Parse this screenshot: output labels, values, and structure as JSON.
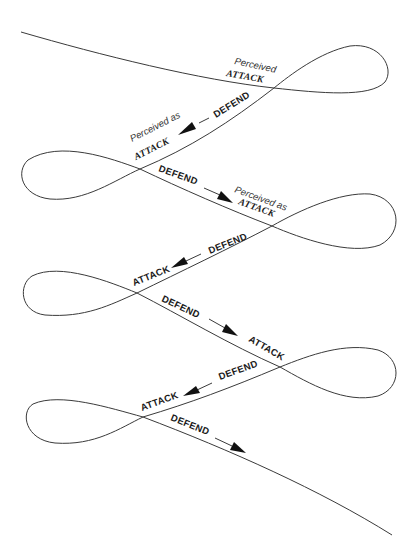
{
  "diagram": {
    "colors": {
      "line": "#3a3a3a",
      "text": "#1a1a1a",
      "background": "#ffffff"
    },
    "labels": {
      "l1_perceived": "Perceived",
      "l1_attack": "ATTACK",
      "l1_defend": "DEFEND",
      "l2_perceived": "Perceived as",
      "l2_attack": "ATTACK",
      "l2_defend": "DEFEND",
      "l3_perceived": "Perceived as",
      "l3_attack": "ATTACK",
      "l3_defend": "DEFEND",
      "l4_attack": "ATTACK",
      "l4_defend": "DEFEND",
      "l5_attack": "ATTACK",
      "l5_defend": "DEFEND",
      "l6_attack": "ATTACK",
      "l6_defend": "DEFEND"
    },
    "arrows": [
      {
        "from": [
          227,
          111
        ],
        "to": [
          199,
          124
        ],
        "direction": "down-left"
      },
      {
        "from": [
          205,
          187
        ],
        "to": [
          236,
          201
        ],
        "direction": "down-right"
      },
      {
        "from": [
          200,
          254
        ],
        "to": [
          172,
          268
        ],
        "direction": "down-left"
      },
      {
        "from": [
          209,
          320
        ],
        "to": [
          238,
          335
        ],
        "direction": "down-right"
      },
      {
        "from": [
          212,
          384
        ],
        "to": [
          184,
          397
        ],
        "direction": "down-left"
      },
      {
        "from": [
          215,
          438
        ],
        "to": [
          246,
          452
        ],
        "direction": "down-right"
      }
    ]
  }
}
